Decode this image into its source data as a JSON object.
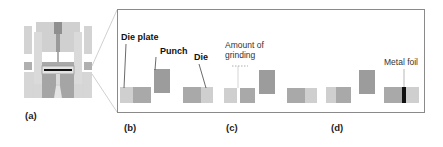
{
  "figure": {
    "panels": [
      {
        "id": "a",
        "label": "(a)",
        "description": "Cross-section of punching die assembly"
      },
      {
        "id": "b",
        "label": "(b)",
        "annotations": [
          "Die plate",
          "Punch",
          "Die"
        ]
      },
      {
        "id": "c",
        "label": "(c)",
        "annotations": [
          "Amount of grinding"
        ]
      },
      {
        "id": "d",
        "label": "(d)",
        "annotations": [
          "Metal foil"
        ]
      }
    ],
    "labels": {
      "die_plate": "Die plate",
      "punch": "Punch",
      "die": "Die",
      "amount_of_grinding_line1": "Amount of",
      "amount_of_grinding_line2": "grinding",
      "metal_foil": "Metal foil",
      "panel_a": "(a)",
      "panel_b": "(b)",
      "panel_c": "(c)",
      "panel_d": "(d)"
    },
    "colors": {
      "light_gray": "#cfcfcf",
      "mid_gray": "#a9a9a9",
      "dark_gray": "#9c9c9c",
      "foil_black": "#111111",
      "frame": "#8a8a8a"
    }
  }
}
